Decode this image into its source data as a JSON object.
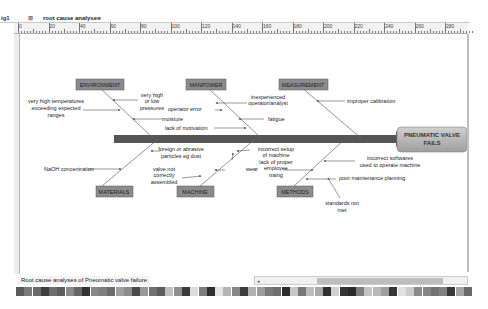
{
  "tabs": {
    "prev_tab_label": "ig1",
    "active_tab_label": "root cause analyses",
    "close_glyph": "×"
  },
  "ruler": {
    "labels": [
      "0",
      "20",
      "40",
      "60",
      "80",
      "100",
      "120",
      "140",
      "160",
      "180",
      "200",
      "220",
      "240",
      "260",
      "280"
    ]
  },
  "diagram": {
    "problem": "PNEUMATIC VALVE FAILS",
    "problem_line1": "PNEUMATIC VALVE",
    "problem_line2": "FAILS",
    "categories": {
      "environment": "ENVIRONMENT",
      "manpower": "MANPOWER",
      "measurement": "MEASUREMENT",
      "materials": "MATERIALS",
      "machine": "MACHINE",
      "methods": "METHODS"
    },
    "causes": {
      "env_temp_1": "very high temperatures",
      "env_temp_2": "exceeding expected",
      "env_temp_3": "ranges",
      "env_press_1": "very high",
      "env_press_2": "or low",
      "env_press_3": "pressures",
      "env_moisture": "moisture",
      "man_error": "operator error",
      "man_inexp_1": "inexperienced",
      "man_inexp_2": "operator/analyst",
      "man_fatigue": "fatigue",
      "man_motivation": "lack of motivation",
      "meas_calibration": "improper calibration",
      "mat_naoh": "NaOH concentration",
      "mat_foreign_1": "foreign or abrasive",
      "mat_foreign_2": "particles eg dust",
      "mach_valve_1": "valve not",
      "mach_valve_2": "correctly",
      "mach_valve_3": "assembled",
      "mach_wear": "wear",
      "mach_setup_1": "incorrect setup",
      "mach_setup_2": "of machine",
      "meth_training_1": "lack of proper",
      "meth_training_2": "employee",
      "meth_training_3": "traing",
      "meth_software_1": "incorrect softwares",
      "meth_software_2": "used to operate machine",
      "meth_maint": "poor maintenance planning",
      "meth_standards_1": "standards not",
      "meth_standards_2": "met"
    }
  },
  "sheet_tab": {
    "label": "Root cause analyses of Pneumatic valve failure"
  },
  "scrollbar": {
    "left_arrow": "◂"
  },
  "palette": {
    "colors": [
      "#5a5a5a",
      "#7a7a7a",
      "#6a6a6a",
      "#3e3e3e",
      "#6e6e6e",
      "#5e5e5e",
      "#8a8a8a",
      "#666666",
      "#333333",
      "#888888",
      "#7e7e7e",
      "#6c6c6c",
      "#a0a0a0",
      "#8c8c8c",
      "#4a4a4a",
      "#9a9a9a",
      "#707070",
      "#5c5c5c",
      "#c0c0c0",
      "#8e8e8e",
      "#3a3a3a",
      "#dcdcdc",
      "#7c7c7c",
      "#2e2e2e",
      "#e4e4e4",
      "#b4b4b4",
      "#868686",
      "#3c3c3c",
      "#b0b0b0",
      "#9c9c9c",
      "#7a7a7a",
      "#6e6e6e",
      "#2c2c2c",
      "#c8c8c8",
      "#787878",
      "#bcbcbc",
      "#a8a8a8",
      "#303030",
      "#d0d0d0",
      "#343434",
      "#2a2a2a",
      "#7e7e7e",
      "#c4c4c4",
      "#b8b8b8",
      "#9e9e9e",
      "#363636",
      "#e0e0e0",
      "#cccccc",
      "#8a8a8a",
      "#868686",
      "#727272",
      "#828282",
      "#393939",
      "#a4a4a4",
      "#6a6a6a"
    ]
  },
  "colors": {
    "spine": "#555555",
    "category_box": "#8c8c8c",
    "problem_box": "#b4b4b4",
    "bone_line": "#666666"
  }
}
